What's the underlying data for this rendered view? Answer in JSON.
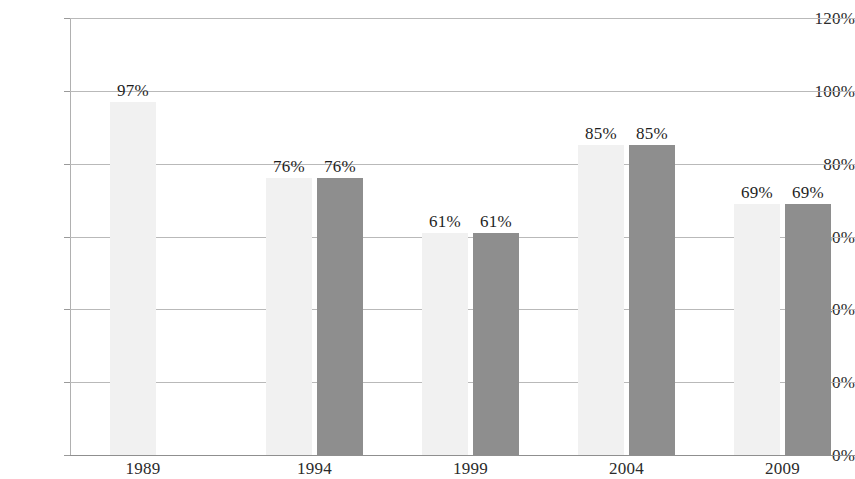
{
  "chart_data": {
    "type": "bar",
    "title": "",
    "subtitle": "",
    "xlabel": "",
    "ylabel": "",
    "categories": [
      "1989",
      "1994",
      "1999",
      "2004",
      "2009"
    ],
    "series": [
      {
        "name": "Series 1",
        "color": "#f1f1f1",
        "values": [
          97,
          76,
          61,
          85,
          69
        ],
        "labels": [
          "97%",
          "76%",
          "61%",
          "85%",
          "69%"
        ]
      },
      {
        "name": "Series 2",
        "color": "#8e8e8e",
        "values": [
          null,
          76,
          61,
          85,
          69
        ],
        "labels": [
          "",
          "76%",
          "61%",
          "85%",
          "69%"
        ]
      }
    ],
    "ylim": [
      0,
      120
    ],
    "ytick_values": [
      120,
      100,
      80,
      60,
      40,
      20,
      0
    ],
    "ytick_labels": [
      "120%",
      "100%",
      "80%",
      "60%",
      "40%",
      "20%",
      "0%"
    ],
    "grid": true,
    "grid_axis": "y",
    "legend": false,
    "legend_position": "none"
  },
  "colors": {
    "background": "#ffffff",
    "gridline": "#b9b9b9",
    "axis": "#b0b0b0",
    "text": "#2b2b2b",
    "series_light": "#f1f1f1",
    "series_dark": "#8e8e8e"
  }
}
